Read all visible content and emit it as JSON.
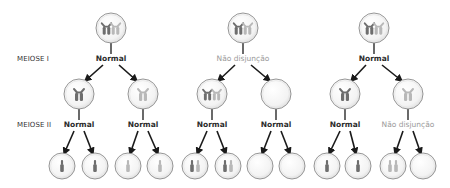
{
  "stage_labels": {
    "meiosis1": "MEIOSE I",
    "meiosis2": "MEIOSE II"
  },
  "colors": {
    "dark_chromosome": "#6e6e6e",
    "light_chromosome": "#b8b8b8",
    "cell_stroke": "#8a8a8a",
    "cell_fill": "#f4f4f4",
    "normal_label": "#2b2b2b",
    "nondisjunction_label": "#9a9a9a",
    "arrow": "#1a1a1a"
  },
  "columns": [
    {
      "parent": {
        "x": 111,
        "y": 28,
        "content": "homolog-pair"
      },
      "meiosis1_event": {
        "label": "Normal",
        "type": "normal"
      },
      "children": [
        {
          "x": 79,
          "y": 94,
          "content": "dark-dyad",
          "meiosis2_event": {
            "label": "Normal",
            "type": "normal"
          },
          "gametes": [
            {
              "x": 62,
              "content": "dark-1"
            },
            {
              "x": 95,
              "content": "dark-1"
            }
          ]
        },
        {
          "x": 143,
          "y": 94,
          "content": "light-dyad",
          "meiosis2_event": {
            "label": "Normal",
            "type": "normal"
          },
          "gametes": [
            {
              "x": 128,
              "content": "light-1"
            },
            {
              "x": 160,
              "content": "light-1"
            }
          ]
        }
      ]
    },
    {
      "parent": {
        "x": 243,
        "y": 28,
        "content": "homolog-pair"
      },
      "meiosis1_event": {
        "label": "Não disjunção",
        "type": "nondisjunction"
      },
      "children": [
        {
          "x": 212,
          "y": 94,
          "content": "both-dyads",
          "meiosis2_event": {
            "label": "Normal",
            "type": "normal"
          },
          "gametes": [
            {
              "x": 195,
              "content": "dark-light"
            },
            {
              "x": 228,
              "content": "dark-light"
            }
          ]
        },
        {
          "x": 276,
          "y": 94,
          "content": "empty",
          "meiosis2_event": {
            "label": "Normal",
            "type": "normal"
          },
          "gametes": [
            {
              "x": 260,
              "content": "empty"
            },
            {
              "x": 292,
              "content": "empty"
            }
          ]
        }
      ]
    },
    {
      "parent": {
        "x": 374,
        "y": 28,
        "content": "homolog-pair"
      },
      "meiosis1_event": {
        "label": "Normal",
        "type": "normal"
      },
      "children": [
        {
          "x": 345,
          "y": 94,
          "content": "dark-dyad",
          "meiosis2_event": {
            "label": "Normal",
            "type": "normal"
          },
          "gametes": [
            {
              "x": 327,
              "content": "dark-1"
            },
            {
              "x": 358,
              "content": "dark-1"
            }
          ]
        },
        {
          "x": 408,
          "y": 94,
          "content": "light-dyad",
          "meiosis2_event": {
            "label": "Não disjunção",
            "type": "nondisjunction"
          },
          "gametes": [
            {
              "x": 393,
              "content": "light-2"
            },
            {
              "x": 423,
              "content": "empty"
            }
          ]
        }
      ]
    }
  ],
  "layout": {
    "parent_r": 15,
    "child_r": 15,
    "gamete_r": 13,
    "gamete_y": 166,
    "m1_label_y": 59,
    "m2_label_y": 125
  }
}
